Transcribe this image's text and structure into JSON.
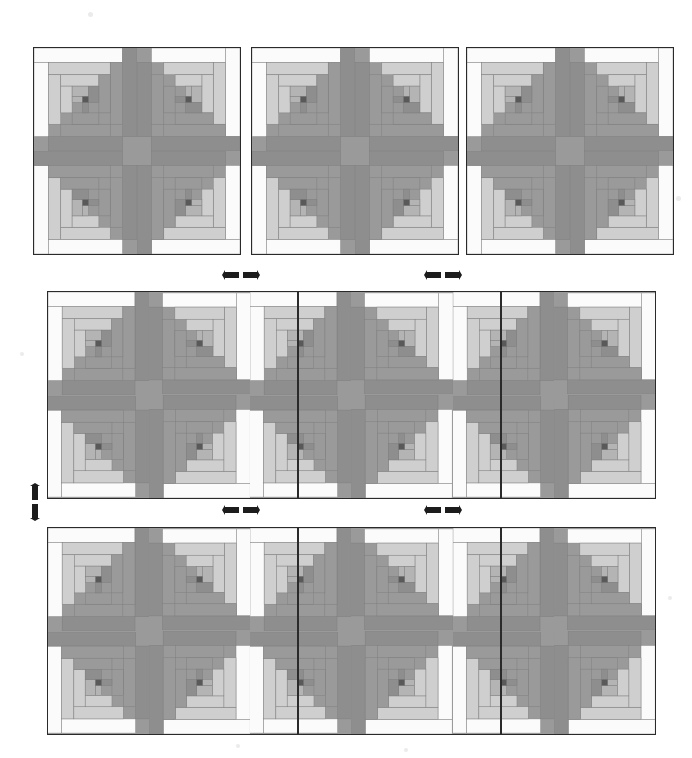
{
  "figure": {
    "name": "log-cabin-quilt-assembly-diagram",
    "background_color": "#ffffff",
    "width": 692,
    "height": 758
  },
  "palette": {
    "white": "#fbfbfb",
    "light_gray": "#cfcfcf",
    "medium_light_gray": "#b4b4b4",
    "medium_gray": "#9a9a9a",
    "dark_gray": "#6f6f6f",
    "center_dark": "#595959",
    "outline": "#2a2a2a",
    "seam": "#7d7d7d"
  },
  "block": {
    "name": "log-cabin-block",
    "rings": 4,
    "center_color": "#595959",
    "ring_colors_light_side": [
      "#fbfbfb",
      "#cfcfcf",
      "#cfcfcf",
      "#b4b4b4"
    ],
    "ring_colors_dark_side": [
      "#8e8e8e",
      "#9a9a9a",
      "#9a9a9a",
      "#8e8e8e"
    ],
    "rotations_deg": [
      0,
      90,
      180,
      270
    ]
  },
  "panels": [
    {
      "name": "top-panel-1",
      "label": "Top Panel 1",
      "x": 33,
      "y": 47,
      "width": 208,
      "height": 208,
      "columns": 2,
      "rows": 2,
      "blocks": [
        {
          "rotation": 0
        },
        {
          "rotation": 90
        },
        {
          "rotation": 270
        },
        {
          "rotation": 180
        }
      ]
    },
    {
      "name": "top-panel-2",
      "label": "Top Panel 2",
      "x": 251,
      "y": 47,
      "width": 208,
      "height": 208,
      "columns": 2,
      "rows": 2,
      "blocks": [
        {
          "rotation": 0
        },
        {
          "rotation": 90
        },
        {
          "rotation": 270
        },
        {
          "rotation": 180
        }
      ]
    },
    {
      "name": "top-panel-3",
      "label": "Top Panel 3",
      "x": 466,
      "y": 47,
      "width": 208,
      "height": 208,
      "columns": 2,
      "rows": 2,
      "blocks": [
        {
          "rotation": 0
        },
        {
          "rotation": 90
        },
        {
          "rotation": 270
        },
        {
          "rotation": 180
        }
      ]
    },
    {
      "name": "middle-panel",
      "label": "Middle Row Panel",
      "x": 47,
      "y": 291,
      "width": 609,
      "height": 208,
      "columns": 6,
      "rows": 2,
      "blocks": [
        {
          "rotation": 0
        },
        {
          "rotation": 90
        },
        {
          "rotation": 0
        },
        {
          "rotation": 90
        },
        {
          "rotation": 0
        },
        {
          "rotation": 90
        },
        {
          "rotation": 270
        },
        {
          "rotation": 180
        },
        {
          "rotation": 270
        },
        {
          "rotation": 180
        },
        {
          "rotation": 270
        },
        {
          "rotation": 180
        }
      ]
    },
    {
      "name": "bottom-panel",
      "label": "Bottom Row Panel",
      "x": 47,
      "y": 527,
      "width": 609,
      "height": 208,
      "columns": 6,
      "rows": 2,
      "blocks": [
        {
          "rotation": 0
        },
        {
          "rotation": 90
        },
        {
          "rotation": 0
        },
        {
          "rotation": 90
        },
        {
          "rotation": 0
        },
        {
          "rotation": 90
        },
        {
          "rotation": 270
        },
        {
          "rotation": 180
        },
        {
          "rotation": 270
        },
        {
          "rotation": 180
        },
        {
          "rotation": 270
        },
        {
          "rotation": 180
        }
      ]
    }
  ],
  "seams": {
    "name": "panel-seam-lines",
    "color": "#2a2a2a",
    "middle_panel_seam_x": [
      250,
      453
    ],
    "bottom_panel_seam_x": [
      250,
      453
    ]
  },
  "arrows": [
    {
      "name": "arrow-join-middle-left",
      "type": "horizontal",
      "x": 222,
      "y": 268
    },
    {
      "name": "arrow-join-middle-right",
      "type": "horizontal",
      "x": 424,
      "y": 268
    },
    {
      "name": "arrow-join-bottom-left",
      "type": "horizontal",
      "x": 222,
      "y": 503
    },
    {
      "name": "arrow-join-bottom-right",
      "type": "horizontal",
      "x": 424,
      "y": 503
    },
    {
      "name": "arrow-join-rows",
      "type": "vertical",
      "x": 28,
      "y": 483
    }
  ],
  "specks": [
    {
      "x": 88,
      "y": 12,
      "size": 5
    },
    {
      "x": 676,
      "y": 196,
      "size": 5
    },
    {
      "x": 20,
      "y": 352,
      "size": 4
    },
    {
      "x": 668,
      "y": 596,
      "size": 4
    },
    {
      "x": 236,
      "y": 744,
      "size": 4
    },
    {
      "x": 404,
      "y": 748,
      "size": 4
    }
  ]
}
